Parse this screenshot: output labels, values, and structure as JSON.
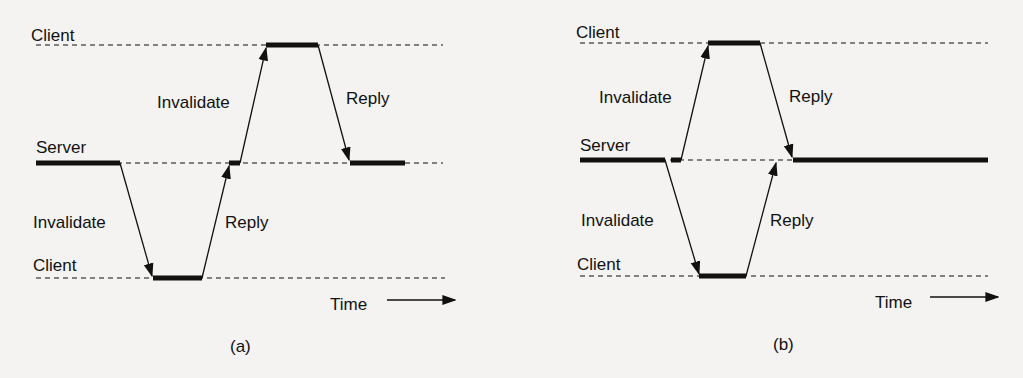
{
  "diagrams": [
    {
      "caption": "(a)",
      "labels": {
        "client_top": "Client",
        "server": "Server",
        "client_bottom": "Client",
        "invalidate_up": "Invalidate",
        "reply_down": "Reply",
        "invalidate_down": "Invalidate",
        "reply_up": "Reply",
        "time": "Time"
      }
    },
    {
      "caption": "(b)",
      "labels": {
        "client_top": "Client",
        "server": "Server",
        "client_bottom": "Client",
        "invalidate_up": "Invalidate",
        "reply_down": "Reply",
        "invalidate_down": "Invalidate",
        "reply_up": "Reply",
        "time": "Time"
      }
    }
  ],
  "colors": {
    "ink": "#111111",
    "background": "#f4f3f1"
  }
}
